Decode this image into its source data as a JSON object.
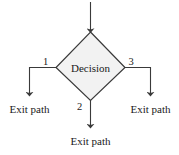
{
  "diagram": {
    "type": "flowchart-decision-node",
    "background_color": "#ffffff",
    "line_color": "#3a3a3a",
    "text_color": "#1a1a1a",
    "node": {
      "shape": "diamond",
      "label": "Decision",
      "fill_color": "#f2f2f2",
      "stroke_color": "#3a3a3a"
    },
    "entry": {
      "name": "entry-arrow",
      "label": ""
    },
    "branches": [
      {
        "number": "1",
        "direction": "left",
        "exit_label": "Exit path"
      },
      {
        "number": "2",
        "direction": "down",
        "exit_label": "Exit path"
      },
      {
        "number": "3",
        "direction": "right",
        "exit_label": "Exit path"
      }
    ]
  }
}
